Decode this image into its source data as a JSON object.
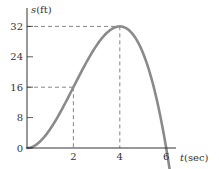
{
  "chart_data": {
    "type": "line",
    "title": "",
    "xlabel": "t (sec)",
    "ylabel": "s (ft)",
    "xlabel_var": "t",
    "xlabel_unit": "(sec)",
    "ylabel_var": "s",
    "ylabel_unit": "(ft)",
    "xlim": [
      0,
      6.5
    ],
    "ylim": [
      0,
      34
    ],
    "grid": false,
    "legend": null,
    "x_ticks": [
      2,
      4,
      6
    ],
    "x_tick_labels": [
      "2",
      "4",
      "6"
    ],
    "y_ticks": [
      0,
      8,
      16,
      24,
      32
    ],
    "y_tick_labels": [
      "0",
      "8",
      "16",
      "24",
      "32"
    ],
    "series": [
      {
        "name": "s(t) = t^2(6 - t)",
        "color": "#888888",
        "x": [
          0,
          0.5,
          1,
          1.5,
          2,
          2.5,
          3,
          3.5,
          4,
          4.5,
          5,
          5.5,
          6,
          6.2
        ],
        "values": [
          0,
          2.75,
          5,
          10.125,
          16,
          21.875,
          27,
          30.625,
          32,
          30.375,
          25,
          15.125,
          0,
          -7.7
        ]
      }
    ],
    "annotations": [
      {
        "type": "dashed-guide",
        "point": [
          2,
          16
        ],
        "label": "(2, 16)"
      },
      {
        "type": "dashed-guide",
        "point": [
          4,
          32
        ],
        "label": "(4, 32) maximum"
      }
    ]
  }
}
